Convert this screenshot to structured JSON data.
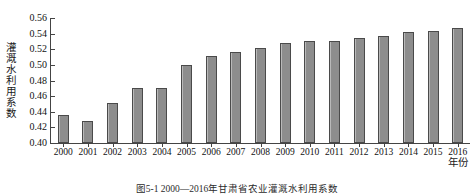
{
  "figure": {
    "caption": "图5-1  2000—2016年甘肃省农业灌溉水利用系数"
  },
  "chart_data": {
    "type": "bar",
    "title": "",
    "subtitle": "",
    "xlabel": "年份",
    "ylabel": "灌溉水利用系数",
    "categories": [
      "2000",
      "2001",
      "2002",
      "2003",
      "2004",
      "2005",
      "2006",
      "2007",
      "2008",
      "2009",
      "2010",
      "2011",
      "2012",
      "2013",
      "2014",
      "2015",
      "2016"
    ],
    "values": [
      0.436,
      0.428,
      0.451,
      0.471,
      0.47,
      0.5,
      0.512,
      0.516,
      0.521,
      0.528,
      0.531,
      0.531,
      0.535,
      0.537,
      0.542,
      0.543,
      0.547
    ],
    "ylim": [
      0.4,
      0.56
    ],
    "yticks": [
      "0.40",
      "0.42",
      "0.44",
      "0.46",
      "0.48",
      "0.50",
      "0.52",
      "0.54",
      "0.56"
    ],
    "ytick_values": [
      0.4,
      0.42,
      0.44,
      0.46,
      0.48,
      0.5,
      0.52,
      0.54,
      0.56
    ],
    "grid": false,
    "legend": null,
    "legend_position": "none",
    "bar_color": "#8e8e8e",
    "bar_edge_color": "#4a4a4a",
    "axis_color": "#444444",
    "background": "#ffffff"
  }
}
